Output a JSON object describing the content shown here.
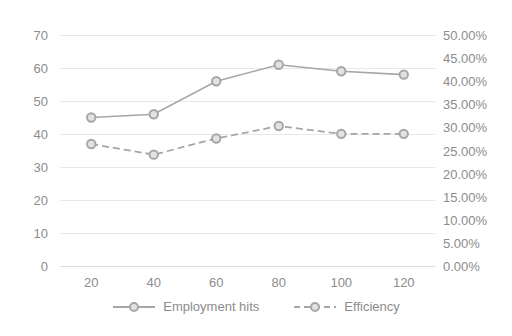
{
  "chart_data": {
    "type": "line",
    "title": "",
    "xlabel": "",
    "ylabel": "",
    "categories": [
      20,
      40,
      60,
      80,
      100,
      120
    ],
    "x_tick_labels": [
      "20",
      "40",
      "60",
      "80",
      "100",
      "120"
    ],
    "grid": true,
    "legend_position": "bottom",
    "axes": {
      "left": {
        "ylim": [
          0,
          70
        ],
        "tick_step": 10,
        "tick_labels": [
          "70",
          "60",
          "50",
          "40",
          "30",
          "20",
          "10",
          "0"
        ],
        "tick_values": [
          70,
          60,
          50,
          40,
          30,
          20,
          10,
          0
        ]
      },
      "right": {
        "ylim": [
          0,
          50
        ],
        "tick_step": 5,
        "unit": "%",
        "tick_labels": [
          "50.00%",
          "45.00%",
          "40.00%",
          "35.00%",
          "30.00%",
          "25.00%",
          "20.00%",
          "15.00%",
          "10.00%",
          "5.00%",
          "0.00%"
        ],
        "tick_values": [
          50,
          45,
          40,
          35,
          30,
          25,
          20,
          15,
          10,
          5,
          0
        ]
      }
    },
    "series": [
      {
        "name": "Employment hits",
        "axis": "left",
        "style": "solid",
        "marker": "circle",
        "color": "#a6a6a6",
        "values": [
          45,
          46,
          56,
          61,
          59,
          58
        ]
      },
      {
        "name": "Efficiency",
        "axis": "right",
        "style": "dashed",
        "marker": "circle",
        "color": "#a6a6a6",
        "values": [
          26.4,
          24.1,
          27.6,
          30.3,
          28.6,
          28.6
        ]
      }
    ]
  },
  "legend": {
    "items": [
      {
        "label": "Employment hits",
        "style": "solid"
      },
      {
        "label": "Efficiency",
        "style": "dashed"
      }
    ]
  },
  "colors": {
    "series": "#a6a6a6",
    "marker_fill": "#e2e2e2",
    "gridline": "#e8e8e8",
    "text": "#8c8c8c",
    "background": "#ffffff"
  }
}
